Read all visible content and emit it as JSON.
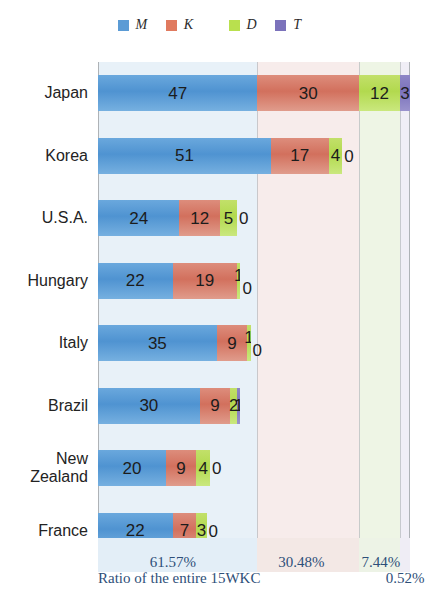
{
  "legend": {
    "items": [
      {
        "label": "M",
        "color": "#5b9bd5",
        "icon": "legend-swatch-m"
      },
      {
        "label": "K",
        "color": "#d2705d",
        "icon": "legend-swatch-k"
      },
      {
        "label": "D",
        "color": "#b2d94e",
        "icon": "legend-swatch-d"
      },
      {
        "label": "T",
        "color": "#7b72bb",
        "icon": "legend-swatch-t"
      }
    ]
  },
  "footer": {
    "caption": "Ratio of the entire 15WKC",
    "percents": [
      "61.57%",
      "30.48%",
      "7.44%",
      "0.52%"
    ]
  },
  "chart_data": {
    "type": "bar",
    "orientation": "horizontal",
    "stacked": true,
    "title": "",
    "xlabel": "",
    "ylabel": "",
    "grid": true,
    "legend_position": "top",
    "categories": [
      "Japan",
      "Korea",
      "U.S.A.",
      "Hungary",
      "Italy",
      "Brazil",
      "New Zealand",
      "France"
    ],
    "series": [
      {
        "name": "M",
        "color": "#5b9bd5",
        "values": [
          47,
          51,
          24,
          22,
          35,
          30,
          20,
          22
        ]
      },
      {
        "name": "K",
        "color": "#d2705d",
        "values": [
          30,
          17,
          12,
          19,
          9,
          9,
          9,
          7
        ]
      },
      {
        "name": "D",
        "color": "#b2d94e",
        "values": [
          12,
          4,
          5,
          1,
          1,
          2,
          4,
          3
        ]
      },
      {
        "name": "T",
        "color": "#7b72bb",
        "values": [
          3,
          0,
          0,
          0,
          0,
          1,
          0,
          0
        ]
      }
    ],
    "totals": [
      92,
      72,
      41,
      42,
      45,
      42,
      33,
      32
    ],
    "ratios": {
      "M": "61.57%",
      "K": "30.48%",
      "D": "7.44%",
      "T": "0.52%"
    },
    "axis_max": 92
  }
}
